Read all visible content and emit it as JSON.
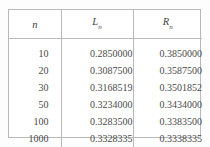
{
  "table": {
    "columns": [
      {
        "symbol": "n",
        "subscript": "",
        "key": "n"
      },
      {
        "symbol": "L",
        "subscript": "n",
        "key": "Ln"
      },
      {
        "symbol": "R",
        "subscript": "n",
        "key": "Rn"
      }
    ],
    "rows": [
      {
        "n": "10",
        "Ln": "0.2850000",
        "Rn": "0.3850000"
      },
      {
        "n": "20",
        "Ln": "0.3087500",
        "Rn": "0.3587500"
      },
      {
        "n": "30",
        "Ln": "0.3168519",
        "Rn": "0.3501852"
      },
      {
        "n": "50",
        "Ln": "0.3234000",
        "Rn": "0.3434000"
      },
      {
        "n": "100",
        "Ln": "0.3283500",
        "Rn": "0.3383500"
      },
      {
        "n": "1000",
        "Ln": "0.3328335",
        "Rn": "0.3338335"
      }
    ]
  },
  "style": {
    "rule_color": "#b9b9b9",
    "text_color": "#4a4a4a",
    "page_background": "#fdfdfd",
    "table_background": "#ffffff"
  }
}
